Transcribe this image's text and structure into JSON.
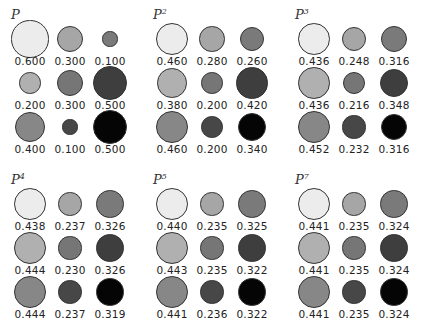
{
  "panels": [
    {
      "title": "P",
      "power": "",
      "values": [
        [
          "0.600",
          "0.300",
          "0.100"
        ],
        [
          "0.200",
          "0.300",
          "0.500"
        ],
        [
          "0.400",
          "0.100",
          "0.500"
        ]
      ]
    },
    {
      "title": "P",
      "power": "2",
      "values": [
        [
          "0.460",
          "0.280",
          "0.260"
        ],
        [
          "0.380",
          "0.200",
          "0.420"
        ],
        [
          "0.460",
          "0.200",
          "0.340"
        ]
      ]
    },
    {
      "title": "P",
      "power": "3",
      "values": [
        [
          "0.436",
          "0.248",
          "0.316"
        ],
        [
          "0.436",
          "0.216",
          "0.348"
        ],
        [
          "0.452",
          "0.232",
          "0.316"
        ]
      ]
    },
    {
      "title": "P",
      "power": "4",
      "values": [
        [
          "0.438",
          "0.237",
          "0.326"
        ],
        [
          "0.444",
          "0.230",
          "0.326"
        ],
        [
          "0.444",
          "0.237",
          "0.319"
        ]
      ]
    },
    {
      "title": "P",
      "power": "5",
      "values": [
        [
          "0.440",
          "0.235",
          "0.325"
        ],
        [
          "0.443",
          "0.235",
          "0.322"
        ],
        [
          "0.441",
          "0.236",
          "0.322"
        ]
      ]
    },
    {
      "title": "P",
      "power": "7",
      "values": [
        [
          "0.441",
          "0.235",
          "0.324"
        ],
        [
          "0.441",
          "0.235",
          "0.324"
        ],
        [
          "0.441",
          "0.235",
          "0.324"
        ]
      ]
    }
  ],
  "colors": {
    "row_col": [
      [
        "#ececec",
        "#a6a6a6",
        "#7a7a7a"
      ],
      [
        "#b0b0b0",
        "#767676",
        "#3e3e3e"
      ],
      [
        "#878787",
        "#474747",
        "#050505"
      ]
    ],
    "stroke": "#333333"
  }
}
